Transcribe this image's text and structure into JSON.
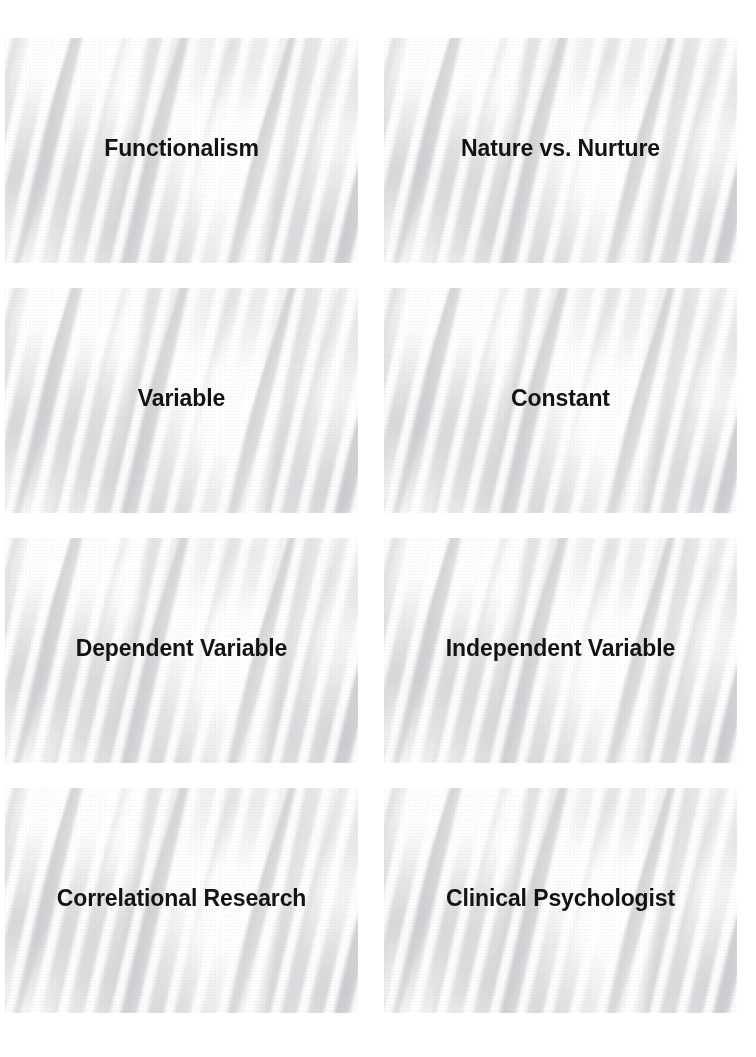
{
  "page": {
    "kind": "flashcard-sheet",
    "columns": 2,
    "rows": 4,
    "background_color": "#ffffff",
    "label_color": "#131313",
    "card_background_texture": "scanned-diagonal-grey-streaks"
  },
  "cards": [
    {
      "id": "card-1",
      "label": "Functionalism",
      "row": 1,
      "column": 1
    },
    {
      "id": "card-2",
      "label": "Nature vs. Nurture",
      "row": 1,
      "column": 2
    },
    {
      "id": "card-3",
      "label": "Variable",
      "row": 2,
      "column": 1
    },
    {
      "id": "card-4",
      "label": "Constant",
      "row": 2,
      "column": 2
    },
    {
      "id": "card-5",
      "label": "Dependent Variable",
      "row": 3,
      "column": 1
    },
    {
      "id": "card-6",
      "label": "Independent Variable",
      "row": 3,
      "column": 2
    },
    {
      "id": "card-7",
      "label": "Correlational Research",
      "row": 4,
      "column": 1
    },
    {
      "id": "card-8",
      "label": "Clinical Psychologist",
      "row": 4,
      "column": 2
    }
  ]
}
